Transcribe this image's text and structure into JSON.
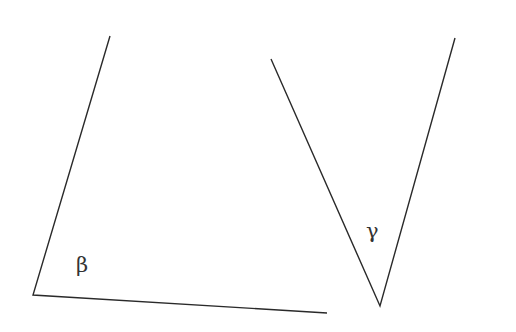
{
  "diagram": {
    "type": "angles",
    "stroke_color": "#2a2a2a",
    "label_color": "#333333",
    "angles": [
      {
        "label": "β",
        "vertex": [
          33,
          295
        ],
        "ray1_end": [
          110,
          36
        ],
        "ray2_end": [
          327,
          313
        ],
        "label_pos": [
          76,
          272
        ]
      },
      {
        "label": "γ",
        "vertex": [
          380,
          306
        ],
        "ray1_end": [
          271,
          59
        ],
        "ray2_end": [
          455,
          38
        ],
        "label_pos": [
          366,
          238
        ]
      }
    ]
  }
}
